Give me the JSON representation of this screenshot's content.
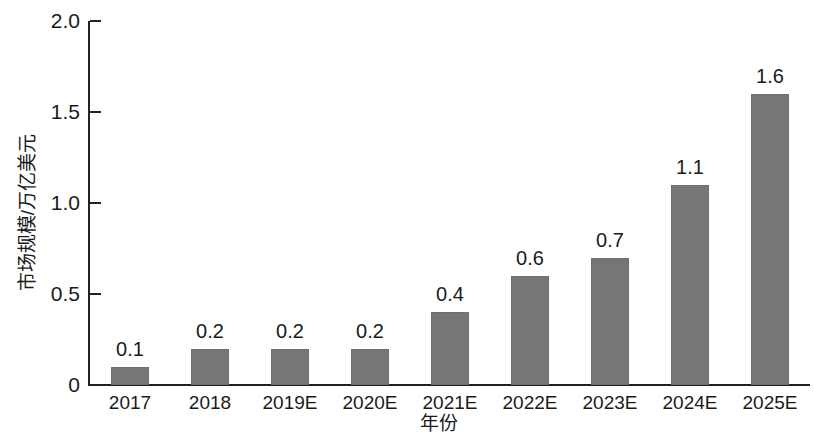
{
  "chart_data": {
    "type": "bar",
    "title": "",
    "subtitle": "",
    "xlabel": "年份",
    "ylabel": "市场规模/万亿美元",
    "categories": [
      "2017",
      "2018",
      "2019E",
      "2020E",
      "2021E",
      "2022E",
      "2023E",
      "2024E",
      "2025E"
    ],
    "values": [
      0.1,
      0.2,
      0.2,
      0.2,
      0.4,
      0.6,
      0.7,
      1.1,
      1.6
    ],
    "value_labels": [
      "0.1",
      "0.2",
      "0.2",
      "0.2",
      "0.4",
      "0.6",
      "0.7",
      "1.1",
      "1.6"
    ],
    "ylim": [
      0,
      2.0
    ],
    "y_ticks": [
      0,
      0.5,
      1.0,
      1.5,
      2.0
    ],
    "y_tick_labels": [
      "0",
      "0.5",
      "1.0",
      "1.5",
      "2.0"
    ],
    "grid": false,
    "legend": null,
    "bar_color": "#767676",
    "axis_color": "#222222",
    "text_color": "#1a1a1a",
    "background_color": "#ffffff"
  }
}
